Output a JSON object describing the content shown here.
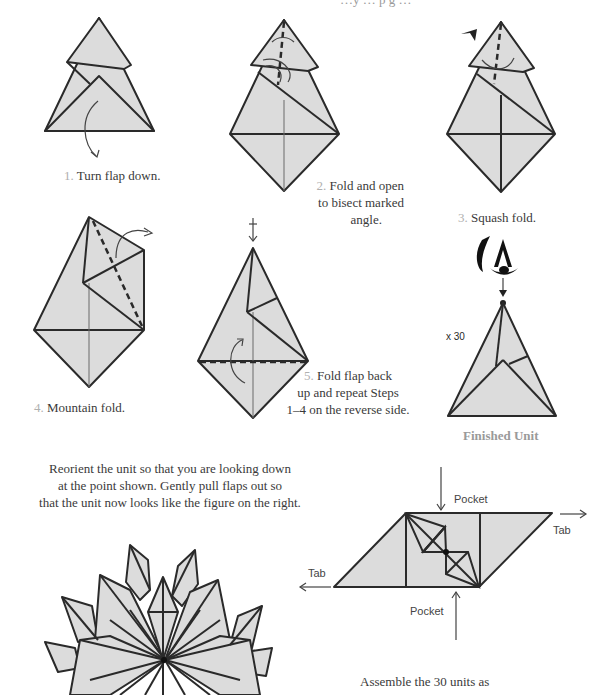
{
  "header": {
    "partial_text": "…y … p g …"
  },
  "steps": [
    {
      "number": "1.",
      "text": "Turn flap down."
    },
    {
      "number": "2.",
      "text_lines": [
        "Fold and open",
        "to bisect marked",
        "angle."
      ]
    },
    {
      "number": "3.",
      "text": "Squash fold."
    },
    {
      "number": "4.",
      "text": "Mountain fold."
    },
    {
      "number": "5.",
      "text_lines": [
        "Fold flap back",
        "up and repeat  Steps",
        "1–4 on the reverse side."
      ]
    }
  ],
  "finished_unit": {
    "label": "Finished Unit",
    "multiplier": "x 30"
  },
  "reorient": {
    "lines": [
      "Reorient the unit so that you are looking down",
      "at the point shown.  Gently pull flaps out so",
      "that the unit now looks like the figure on the right."
    ]
  },
  "assembly_diagram": {
    "labels": {
      "pocket_top": "Pocket",
      "pocket_bottom": "Pocket",
      "tab_right": "Tab",
      "tab_left": "Tab"
    }
  },
  "assemble": {
    "text": "Assemble the  30  units as"
  },
  "colors": {
    "paper": "#dcdcdc",
    "stroke": "#2a2a2a",
    "step_number": "#b0b0b0",
    "finished_label": "#9a9a9a"
  }
}
